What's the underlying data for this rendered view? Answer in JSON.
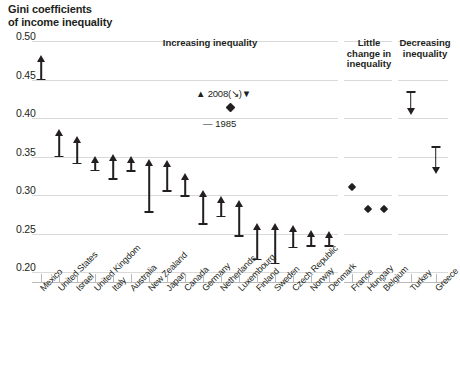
{
  "title": "Gini coefficients\nof income inequality",
  "axis": {
    "y_ticks": [
      "0.50",
      "0.45",
      "0.40",
      "0.35",
      "0.30",
      "0.25",
      "0.20"
    ],
    "ylim": [
      0.2,
      0.5
    ]
  },
  "panels": [
    {
      "id": "increasing",
      "label": "Increasing inequality"
    },
    {
      "id": "little-change",
      "label": "Little\nchange in\ninequality"
    },
    {
      "id": "decreasing",
      "label": "Decreasing\ninequality"
    }
  ],
  "legend": {
    "top": "▲ 2008(↘)▼",
    "bottom": "— 1985"
  },
  "chart_data": {
    "type": "range",
    "title": "Gini coefficients of income inequality",
    "xlabel": "",
    "ylabel": "Gini coefficient",
    "ylim": [
      0.2,
      0.5
    ],
    "ytick_values": [
      0.5,
      0.45,
      0.4,
      0.35,
      0.3,
      0.25,
      0.2
    ],
    "grid": true,
    "legend_entries": [
      "2008",
      "1985"
    ],
    "series": [
      {
        "name": "1985",
        "marker": "bar-cap"
      },
      {
        "name": "2008",
        "marker": "arrow-head"
      }
    ],
    "groups": [
      {
        "name": "Increasing inequality",
        "direction": "up",
        "points": [
          {
            "country": "Mexico",
            "v1985": 0.45,
            "v2008": 0.476
          },
          {
            "country": "United States",
            "v1985": 0.35,
            "v2008": 0.381
          },
          {
            "country": "Israel",
            "v1985": 0.341,
            "v2008": 0.371
          },
          {
            "country": "United Kingdom",
            "v1985": 0.332,
            "v2008": 0.345
          },
          {
            "country": "Italy",
            "v1985": 0.321,
            "v2008": 0.348
          },
          {
            "country": "Australia",
            "v1985": 0.331,
            "v2008": 0.345
          },
          {
            "country": "New Zealand",
            "v1985": 0.278,
            "v2008": 0.341
          },
          {
            "country": "Japan",
            "v1985": 0.305,
            "v2008": 0.34
          },
          {
            "country": "Canada",
            "v1985": 0.299,
            "v2008": 0.324
          },
          {
            "country": "Germany",
            "v1985": 0.262,
            "v2008": 0.301
          },
          {
            "country": "Netherlands",
            "v1985": 0.272,
            "v2008": 0.294
          },
          {
            "country": "Luxembourg",
            "v1985": 0.247,
            "v2008": 0.288
          },
          {
            "country": "Finland",
            "v1985": 0.216,
            "v2008": 0.259
          },
          {
            "country": "Sweden",
            "v1985": 0.211,
            "v2008": 0.259
          },
          {
            "country": "Czech Republic",
            "v1985": 0.232,
            "v2008": 0.256
          },
          {
            "country": "Norway",
            "v1985": 0.234,
            "v2008": 0.25
          },
          {
            "country": "Denmark",
            "v1985": 0.234,
            "v2008": 0.248
          }
        ]
      },
      {
        "name": "Little change in inequality",
        "direction": "flat",
        "points": [
          {
            "country": "France",
            "v1985": 0.31,
            "v2008": 0.31
          },
          {
            "country": "Hungary",
            "v1985": 0.281,
            "v2008": 0.281
          },
          {
            "country": "Belgium",
            "v1985": 0.281,
            "v2008": 0.281
          }
        ]
      },
      {
        "name": "Decreasing inequality",
        "direction": "down",
        "points": [
          {
            "country": "Turkey",
            "v1985": 0.434,
            "v2008": 0.409
          },
          {
            "country": "Greece",
            "v1985": 0.362,
            "v2008": 0.332
          }
        ]
      }
    ]
  }
}
